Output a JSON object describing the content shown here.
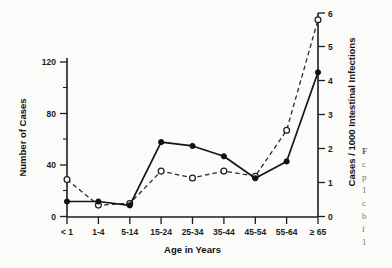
{
  "figure": {
    "background_color": "#fbfbf9",
    "ink_color": "#141414"
  },
  "axes": {
    "x_title": "Age in Years",
    "y_left_title": "Number of Cases",
    "y_right_title": "Cases / 1000 Intestinal Infections"
  },
  "caption_fragment": {
    "line1": "F",
    "line2": "c",
    "line3": "p",
    "line4": "1",
    "line5": "c",
    "line6": "b",
    "line7": "f",
    "line8": "1"
  },
  "chart_data": {
    "type": "line",
    "title": "",
    "xlabel": "Age in Years",
    "categories": [
      "< 1",
      "1-4",
      "5-14",
      "15-24",
      "25-34",
      "35-44",
      "45-54",
      "55-64",
      "≥ 65"
    ],
    "grid": false,
    "legend_position": "none",
    "axes": {
      "left": {
        "label": "Number of Cases",
        "ticks": [
          0,
          40,
          80,
          120
        ],
        "minor_ticks": [
          20,
          60,
          100
        ],
        "range": [
          0,
          120
        ]
      },
      "right": {
        "label": "Cases / 1000 Intestinal Infections",
        "ticks": [
          0,
          1,
          2,
          3,
          4,
          5,
          6
        ],
        "range": [
          0,
          6
        ]
      },
      "x_tick_labels": [
        "< 1",
        "1-4",
        "5-14",
        "15-24",
        "25-34",
        "35-44",
        "45-54",
        "55-64",
        "≥ 65"
      ]
    },
    "series": [
      {
        "name": "Number of Cases",
        "axis": "left",
        "line_style": "solid",
        "marker": "filled-circle",
        "values": [
          12,
          12,
          9,
          58,
          55,
          47,
          30,
          43,
          112
        ]
      },
      {
        "name": "Cases / 1000 Intestinal Infections",
        "axis": "right",
        "line_style": "dashed",
        "marker": "open-circle",
        "values": [
          1.1,
          0.35,
          0.4,
          1.35,
          1.15,
          1.35,
          1.2,
          2.55,
          5.8
        ]
      }
    ]
  }
}
